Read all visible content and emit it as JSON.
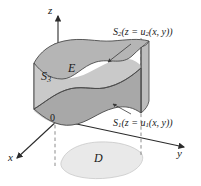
{
  "figure": {
    "type": "3d-solid-region-diagram",
    "axes": {
      "z_label": "z",
      "x_label": "x",
      "y_label": "y",
      "origin_label": "0"
    },
    "labels": {
      "upper_surface": {
        "name": "S",
        "subscript": "2",
        "equation_prefix": "(z = u",
        "equation_subscript": "2",
        "equation_suffix": "(x, y))",
        "full_text": "S2 (z = u2(x, y))"
      },
      "lower_surface": {
        "name": "S",
        "subscript": "1",
        "equation_prefix": "(z = u",
        "equation_subscript": "1",
        "equation_suffix": "(x, y))",
        "full_text": "S1 (z = u1(x, y))"
      },
      "lateral_surface": {
        "name": "S",
        "subscript": "3",
        "full_text": "S3"
      },
      "solid_region": "E",
      "projection_region": "D"
    },
    "colors": {
      "upper_surface_fill": "#b9b9b9",
      "lower_surface_fill": "#a9a9a9",
      "lateral_surface_fill": "#cfcfcf",
      "side_wall_fill": "#c4c4c4",
      "projection_fill": "#e8e8e8",
      "stroke": "#4a4a4a",
      "axis_stroke": "#2b2b2b",
      "dashed_stroke": "#6b6b6b",
      "text": "#1a1a1a"
    }
  }
}
